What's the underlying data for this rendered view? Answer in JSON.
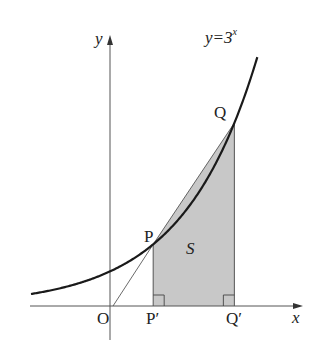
{
  "diagram": {
    "curve_label": {
      "base": "y=3",
      "exponent": "x"
    },
    "axis_labels": {
      "x": "x",
      "y": "y"
    },
    "points": {
      "origin": "O",
      "P": "P",
      "Q": "Q",
      "P_foot": "P′",
      "Q_foot": "Q′"
    },
    "region_label": "S",
    "colors": {
      "line": "#1a1a1a",
      "axis": "#555555",
      "fill": "#c8c8c8"
    },
    "geometry": {
      "origin_px": [
        113,
        306
      ],
      "unit_x_px": 82,
      "unit_y_px": 36,
      "P_x": 0.49,
      "Q_x": 1.48,
      "curve_x_range": [
        -1.0,
        1.76
      ]
    }
  }
}
